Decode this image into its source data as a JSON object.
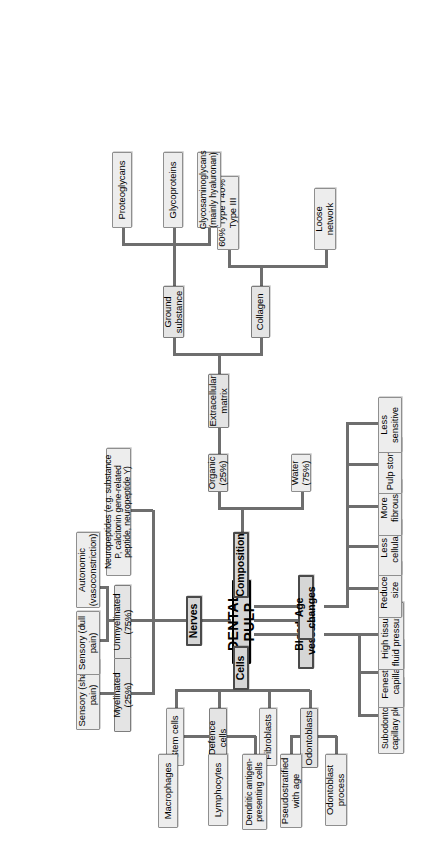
{
  "diagram": {
    "type": "mind-map",
    "title": "DENTAL PULP",
    "center": {
      "label": "DENTAL PULP"
    },
    "branches": {
      "nerves": {
        "label": "Nerves"
      },
      "cells": {
        "label": "Cells"
      },
      "composition": {
        "label": "Composition"
      },
      "blood_vessels": {
        "label": "Blood vessels"
      },
      "age_changes": {
        "label": "Age changes"
      }
    },
    "nerves": {
      "myelinated": {
        "label": "Myelinated (25%)"
      },
      "unmyelinated": {
        "label": "Unmyelinated (75%)"
      },
      "neuropeptides": {
        "label": "Neuropeptides (e.g. substance P, calcitonin gene-related peptide, neuropeptide Y)"
      },
      "sensory_sharp": {
        "label": "Sensory (sharp pain)"
      },
      "sensory_dull": {
        "label": "Sensory (dull pain)"
      },
      "autonomic": {
        "label": "Autonomic (vasoconstriction)"
      }
    },
    "cells": {
      "odontoblasts": {
        "label": "Odontoblasts"
      },
      "fibroblasts": {
        "label": "Fibroblasts"
      },
      "defence_cells": {
        "label": "Defence cells"
      },
      "stem_cells": {
        "label": "Stem cells"
      },
      "odontoblast_process": {
        "label": "Odontoblast process"
      },
      "pseudostratified": {
        "label": "Pseudostratified with age"
      },
      "macrophages": {
        "label": "Macrophages"
      },
      "lymphocytes": {
        "label": "Lymphocytes"
      },
      "dendritic": {
        "label": "Dendritic antigen-presenting cells"
      }
    },
    "composition": {
      "water": {
        "label": "Water (75%)"
      },
      "organic": {
        "label": "Organic (25%)"
      },
      "extracellular_matrix": {
        "label": "Extracellular matrix"
      },
      "collagen": {
        "label": "Collagen"
      },
      "ground_substance": {
        "label": "Ground substance"
      },
      "loose_network": {
        "label": "Loose network"
      },
      "collagen_types": {
        "label": "60% Type I 40% Type III"
      },
      "proteoglycans": {
        "label": "Proteoglycans"
      },
      "glycoproteins": {
        "label": "Glycoproteins"
      },
      "glycosaminoglycans": {
        "label": "Glycosaminoglycans (mainly hyaluronan)"
      }
    },
    "blood_vessels": {
      "subodontoblastic": {
        "label": "Subodontoblastic capillary plexuses"
      },
      "fenestrated": {
        "label": "Fenestrated capillaries"
      },
      "high_pressure": {
        "label": "High tissue fluid pressures"
      }
    },
    "age_changes": {
      "reduced_size": {
        "label": "Reduced size"
      },
      "less_cellular": {
        "label": "Less cellular"
      },
      "more_fibrous": {
        "label": "More fibrous"
      },
      "pulp_stones": {
        "label": "Pulp stones"
      },
      "less_sensitive": {
        "label": "Less sensitive"
      }
    },
    "colors": {
      "center_fill": "#d4d4d4",
      "branch_fill": "#d6d6d6",
      "leaf_fill": "#ededed",
      "connector": "#6e6e6e",
      "border": "#8a8a8a",
      "background": "#ffffff"
    }
  }
}
